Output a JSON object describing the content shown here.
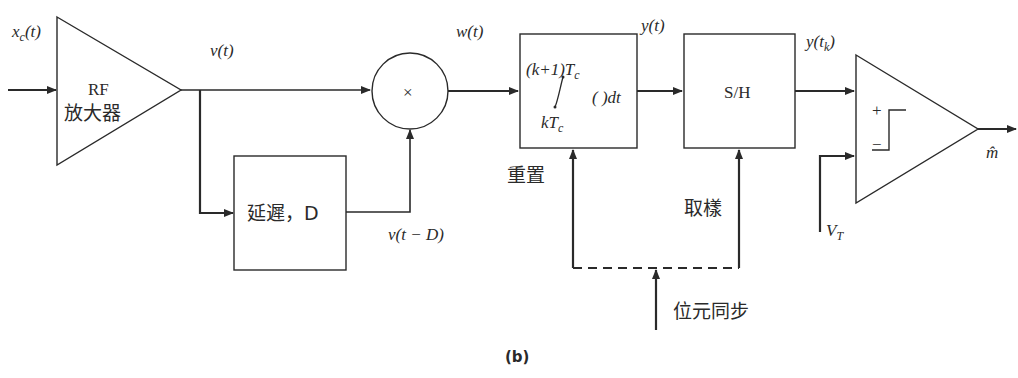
{
  "figure": {
    "caption": "(b)",
    "blocks": {
      "rf_amp": {
        "line1": "RF",
        "line2": "放大器"
      },
      "multiplier": {
        "symbol": "×"
      },
      "delay": {
        "label": "延遲，D"
      },
      "integrator": {
        "upper": "(k+1)T",
        "upper_sub": "c",
        "lower": "kT",
        "lower_sub": "c",
        "integrand": "( )dt"
      },
      "sample_hold": {
        "label": "S/H"
      },
      "comparator": {
        "plus": "+",
        "minus": "−"
      }
    },
    "signals": {
      "input": {
        "main": "x",
        "sub": "c",
        "arg": "(t)"
      },
      "v": "v(t)",
      "w": "w(t)",
      "v_delayed": "v(t − D)",
      "y": "y(t)",
      "y_sampled": {
        "main": "y(t",
        "sub": "k",
        "close": ")"
      },
      "threshold": {
        "main": "V",
        "sub": "T"
      },
      "output": "m̂"
    },
    "control_labels": {
      "reset": "重置",
      "sample": "取樣",
      "bit_sync": "位元同步"
    }
  }
}
